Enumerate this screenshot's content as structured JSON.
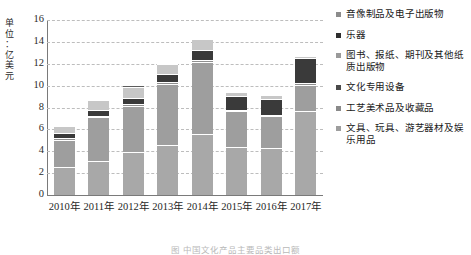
{
  "chart_data": {
    "type": "bar",
    "subtype": "stacked",
    "title": "",
    "xlabel": "",
    "ylabel": "单位：亿美元",
    "ylim": [
      0,
      16
    ],
    "ytick_step": 2,
    "yticks": [
      16,
      14,
      12,
      10,
      8,
      6,
      4,
      2,
      0
    ],
    "grid": true,
    "legend_position": "right",
    "categories": [
      "2010年",
      "2011年",
      "2012年",
      "2013年",
      "2014年",
      "2015年",
      "2016年",
      "2017年"
    ],
    "series": [
      {
        "name": "文具、玩具、游艺器材及娱乐用品",
        "color": "#a8a8a8",
        "values": [
          2.55,
          3.1,
          3.95,
          4.55,
          5.6,
          4.35,
          4.3,
          7.7
        ]
      },
      {
        "name": "工艺美术品及收藏品",
        "color": "#9e9e9e",
        "values": [
          2.5,
          4.0,
          4.2,
          5.6,
          6.6,
          3.3,
          2.9,
          2.4
        ]
      },
      {
        "name": "文化专用设备",
        "color": "#8f8f8f",
        "values": [
          0.15,
          0.1,
          0.15,
          0.15,
          0.1,
          0.1,
          0.1,
          0.1
        ]
      },
      {
        "name": "图书、报纸、期刊及其他纸质出版物",
        "color": "#3a3a3a",
        "values": [
          0.45,
          0.55,
          0.6,
          0.75,
          1.0,
          1.3,
          1.45,
          2.3
        ]
      },
      {
        "name": "乐器",
        "color": "#c7c7c7",
        "values": [
          0.65,
          0.9,
          0.95,
          0.9,
          0.95,
          0.35,
          0.35,
          0.2
        ]
      },
      {
        "name": "音像制品及电子出版物",
        "color": "#5c5c5c",
        "values": [
          0.1,
          0.1,
          0.2,
          0.15,
          0.1,
          0.1,
          0.1,
          0.1
        ]
      }
    ],
    "totals": [
      6.4,
      8.75,
      10.05,
      12.1,
      14.35,
      9.5,
      9.2,
      12.8
    ]
  },
  "legend": {
    "items": [
      {
        "label": "音像制品及电子出版物",
        "color": "#8c8c8c"
      },
      {
        "label": "乐器",
        "color": "#2e2e2e"
      },
      {
        "label": "图书、报纸、期刊及其他纸质出版物",
        "color": "#9a9a9a"
      },
      {
        "label": "文化专用设备",
        "color": "#4a4a4a"
      },
      {
        "label": "工艺美术品及收藏品",
        "color": "#8a8a8a"
      },
      {
        "label": "文具、玩具、游艺器材及娱乐用品",
        "color": "#9e9e9e"
      }
    ]
  },
  "axis": {
    "y_unit_line1": "单",
    "y_unit_line2": "位",
    "y_unit_line3": "：",
    "y_unit_line4": "亿",
    "y_unit_line5": "美",
    "y_unit_line6": "元"
  },
  "caption": {
    "text": "图        中国文化产品主要品类出口额"
  }
}
